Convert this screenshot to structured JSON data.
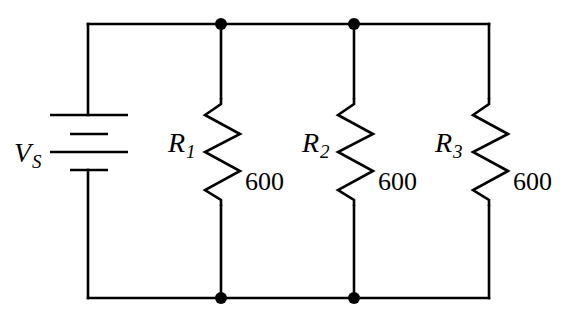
{
  "diagram": {
    "type": "circuit",
    "source": {
      "symbol": "V",
      "subscript": "S"
    },
    "resistors": [
      {
        "symbol": "R",
        "subscript": "1",
        "value": "600"
      },
      {
        "symbol": "R",
        "subscript": "2",
        "value": "600"
      },
      {
        "symbol": "R",
        "subscript": "3",
        "value": "600"
      }
    ],
    "junctions": 4,
    "colors": {
      "line": "#000000",
      "background": "#ffffff"
    }
  }
}
